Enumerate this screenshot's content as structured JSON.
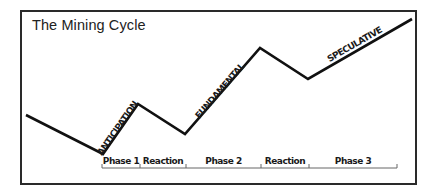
{
  "title": "The Mining Cycle",
  "colors": {
    "line": "#111111",
    "frame": "#2a2a2a",
    "bracket": "#666666",
    "background": "#ffffff"
  },
  "cycle_line": {
    "points": [
      [
        26,
        115
      ],
      [
        103,
        154
      ],
      [
        138,
        104
      ],
      [
        185,
        134
      ],
      [
        260,
        48
      ],
      [
        308,
        79
      ],
      [
        412,
        19
      ]
    ]
  },
  "stages": [
    {
      "label": "ANTICIPATION",
      "x": 120,
      "y": 130,
      "angle": -55
    },
    {
      "label": "FUNDAMENTAL",
      "x": 222,
      "y": 93,
      "angle": -49
    },
    {
      "label": "SPECULATIVE",
      "x": 356,
      "y": 47,
      "angle": -30
    }
  ],
  "phases": [
    {
      "label": "Phase 1",
      "start": 102,
      "end": 140
    },
    {
      "label": "Reaction",
      "start": 140,
      "end": 186
    },
    {
      "label": "Phase 2",
      "start": 186,
      "end": 261
    },
    {
      "label": "Reaction",
      "start": 261,
      "end": 309
    },
    {
      "label": "Phase 3",
      "start": 309,
      "end": 397
    }
  ]
}
